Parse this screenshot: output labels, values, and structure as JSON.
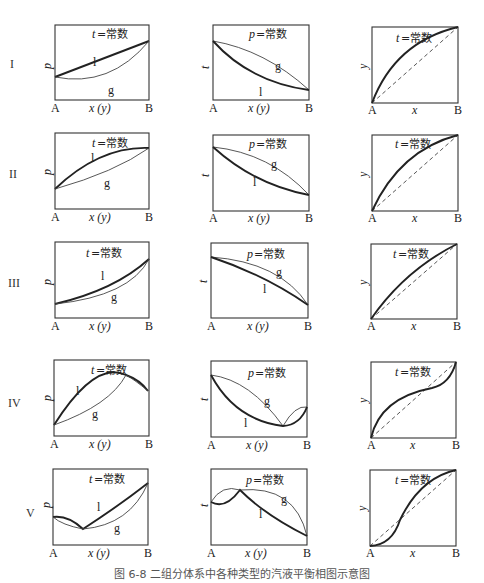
{
  "figure": {
    "caption": "图 6-8  二组分体系中各种类型的汽液平衡相图示意图",
    "rows": [
      {
        "id": "I",
        "label": "I"
      },
      {
        "id": "II",
        "label": "II"
      },
      {
        "id": "III",
        "label": "III"
      },
      {
        "id": "IV",
        "label": "IV"
      },
      {
        "id": "V",
        "label": "V"
      }
    ],
    "columns": [
      {
        "type": "p-x(y)",
        "condition": "t=常数",
        "cond_var": "t",
        "cond_text": "=常数",
        "ylabel": "p",
        "xlabel": "x (y)",
        "left": "A",
        "right": "B"
      },
      {
        "type": "t-x(y)",
        "condition": "p=常数",
        "cond_var": "p",
        "cond_text": "=常数",
        "ylabel": "t",
        "xlabel": "x (y)",
        "left": "A",
        "right": "B"
      },
      {
        "type": "y-x",
        "condition": "t=常数",
        "cond_var": "t",
        "cond_text": "=常数",
        "ylabel": "y",
        "xlabel": "x",
        "left": "A",
        "right": "B"
      }
    ],
    "curve_labels": {
      "liquid": "l",
      "vapor": "g"
    },
    "legend_notes": {
      "thick_line": "liquid line (l)",
      "thin_line": "vapor line (g)",
      "dashed_line": "diagonal y = x"
    },
    "row_descriptions": {
      "I": "ideal-like: l straight, g convex below",
      "II": "positive deviation: l convex above",
      "III": "negative deviation (small): l slightly convex below",
      "IV": "maximum-pressure / minimum-boiling azeotrope",
      "V": "minimum-pressure / maximum-boiling azeotrope"
    }
  }
}
